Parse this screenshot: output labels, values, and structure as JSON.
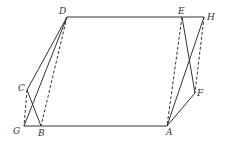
{
  "diagram": {
    "type": "geometry",
    "points": {
      "D": {
        "x": 67,
        "y": 17,
        "label": "D",
        "lx": 59,
        "ly": 14
      },
      "E": {
        "x": 182,
        "y": 17,
        "label": "E",
        "lx": 178,
        "ly": 14
      },
      "H": {
        "x": 204,
        "y": 17,
        "label": "H",
        "lx": 207,
        "ly": 20
      },
      "C": {
        "x": 27,
        "y": 90,
        "label": "C",
        "lx": 18,
        "ly": 91
      },
      "G": {
        "x": 24,
        "y": 126,
        "label": "G",
        "lx": 13,
        "ly": 134
      },
      "B": {
        "x": 41,
        "y": 126,
        "label": "B",
        "lx": 38,
        "ly": 136
      },
      "A": {
        "x": 167,
        "y": 126,
        "label": "A",
        "lx": 166,
        "ly": 135
      },
      "F": {
        "x": 195,
        "y": 93,
        "label": "F",
        "lx": 197,
        "ly": 96
      }
    },
    "solid_segments": [
      [
        "D",
        "E"
      ],
      [
        "E",
        "H"
      ],
      [
        "G",
        "B"
      ],
      [
        "B",
        "A"
      ],
      [
        "D",
        "C"
      ],
      [
        "C",
        "B"
      ],
      [
        "D",
        "G"
      ],
      [
        "E",
        "A"
      ],
      [
        "H",
        "F"
      ],
      [
        "F",
        "A"
      ],
      [
        "H",
        "A"
      ]
    ],
    "dashed_segments": [
      [
        "D",
        "B"
      ],
      [
        "C",
        "G"
      ],
      [
        "E",
        "A"
      ],
      [
        "H",
        "F"
      ]
    ],
    "labels": [
      "D",
      "E",
      "H",
      "C",
      "G",
      "B",
      "A",
      "F"
    ]
  }
}
